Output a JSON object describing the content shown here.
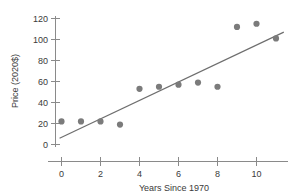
{
  "chart_data": {
    "type": "scatter",
    "title": "",
    "xlabel": "Years Since 1970",
    "ylabel": "Price (2020$)",
    "xlim": [
      -0.7,
      11.9
    ],
    "ylim": [
      -8,
      126
    ],
    "xticks": [
      0,
      2,
      4,
      6,
      8,
      10
    ],
    "xticklabels": [
      "0",
      "2",
      "4",
      "6",
      "8",
      "10"
    ],
    "yticks": [
      0,
      20,
      40,
      60,
      80,
      100,
      120
    ],
    "yticklabels": [
      "0",
      "20",
      "40",
      "60",
      "80",
      "100",
      "120"
    ],
    "grid": false,
    "legend": false,
    "marker_color": "#7b7b7b",
    "line_color": "#6e6e6e",
    "axis_color": "#8a8a8a",
    "text_color": "#3a3a3a",
    "x": [
      0,
      1,
      2,
      3,
      4,
      5,
      6,
      7,
      8,
      9,
      10,
      11
    ],
    "y": [
      22,
      22,
      22,
      19,
      53,
      55,
      57,
      59,
      55,
      112,
      115,
      101
    ],
    "points": [
      {
        "x": 0,
        "y": 22
      },
      {
        "x": 1,
        "y": 22
      },
      {
        "x": 2,
        "y": 22
      },
      {
        "x": 3,
        "y": 19
      },
      {
        "x": 4,
        "y": 53
      },
      {
        "x": 5,
        "y": 55
      },
      {
        "x": 6,
        "y": 57
      },
      {
        "x": 7,
        "y": 59
      },
      {
        "x": 8,
        "y": 55
      },
      {
        "x": 9,
        "y": 112
      },
      {
        "x": 10,
        "y": 115
      },
      {
        "x": 11,
        "y": 101
      }
    ],
    "series": [
      {
        "name": "Price observations",
        "type": "scatter",
        "values": [
          22,
          22,
          22,
          19,
          53,
          55,
          57,
          59,
          55,
          112,
          115,
          101
        ]
      },
      {
        "name": "Trend line",
        "type": "line",
        "x_start": -0.1,
        "y_start": 6,
        "x_end": 11.4,
        "y_end": 107,
        "slope": 8.78,
        "intercept": 6.88
      }
    ],
    "annotations": []
  }
}
